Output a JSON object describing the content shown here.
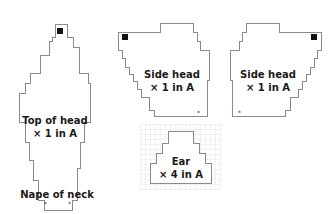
{
  "pieces": [
    {
      "id": "top-of-head",
      "title": "Top of head",
      "quantity": "× 1 in A",
      "extra_label": "Nape of neck"
    },
    {
      "id": "side-head-left",
      "title": "Side head",
      "quantity": "× 1 in A"
    },
    {
      "id": "side-head-right",
      "title": "Side head",
      "quantity": "× 1 in A"
    },
    {
      "id": "ear",
      "title": "Ear",
      "quantity": "× 4 in A"
    }
  ],
  "markers": {
    "start_square": "black-square",
    "dot_symbol": "*"
  }
}
